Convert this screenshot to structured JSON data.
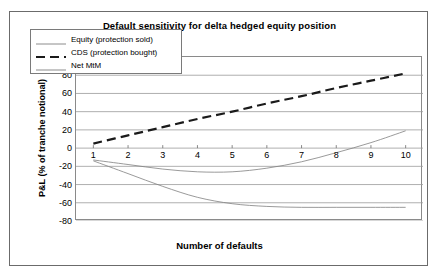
{
  "chart_data": {
    "type": "line",
    "title": "Default sensitivity for delta hedged equity position",
    "xlabel": "Number of defaults",
    "ylabel": "P&L (% of tranche notional)",
    "x": [
      1,
      2,
      3,
      4,
      5,
      6,
      7,
      8,
      9,
      10
    ],
    "xlim": [
      0.5,
      10.5
    ],
    "ylim": [
      -80,
      100
    ],
    "ytick_labels": [
      "100",
      "80",
      "60",
      "40",
      "20",
      "0",
      "-20",
      "-40",
      "-60",
      "-80"
    ],
    "ytick_values": [
      100,
      80,
      60,
      40,
      20,
      0,
      -20,
      -40,
      -60,
      -80
    ],
    "xtick_labels": [
      "1",
      "2",
      "3",
      "4",
      "5",
      "6",
      "7",
      "8",
      "9",
      "10"
    ],
    "grid": "horizontal",
    "legend_position": "upper-left-inside",
    "series": [
      {
        "name": "Equity (protection sold)",
        "style": "solid",
        "color": "#808080",
        "width": 0.8,
        "values": [
          -14,
          -28,
          -42,
          -54,
          -61,
          -64,
          -65,
          -65,
          -65,
          -65
        ]
      },
      {
        "name": "CDS (protection bought)",
        "style": "dashed",
        "color": "#1a1a1a",
        "width": 2.2,
        "values": [
          5,
          14,
          23,
          32,
          40,
          49,
          57,
          66,
          74,
          82
        ]
      },
      {
        "name": "Net MtM",
        "style": "solid",
        "color": "#808080",
        "width": 0.8,
        "values": [
          -13,
          -18,
          -23,
          -26,
          -26,
          -22,
          -15,
          -5,
          6,
          19
        ]
      }
    ]
  },
  "legend": {
    "items": [
      {
        "label": "Equity (protection sold)"
      },
      {
        "label": "CDS (protection bought)"
      },
      {
        "label": "Net MtM"
      }
    ]
  }
}
